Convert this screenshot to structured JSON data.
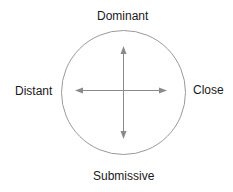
{
  "diagram": {
    "labels": {
      "top": "Dominant",
      "bottom": "Submissive",
      "left": "Distant",
      "right": "Close"
    },
    "colors": {
      "circle": "#9a9a9a",
      "arrows": "#8a8a8a",
      "text": "#1a1a1a"
    }
  }
}
